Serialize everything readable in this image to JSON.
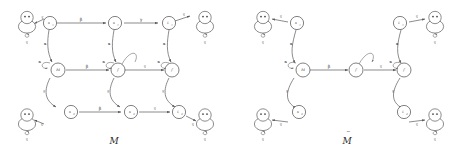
{
  "figure": {
    "panels": [
      {
        "id": "left",
        "caption": "M",
        "caption_accent": "",
        "nodes": [
          {
            "id": "s1",
            "label": "s",
            "sub": "1",
            "kind": "state"
          },
          {
            "id": "s2",
            "label": "s",
            "sub": "1",
            "kind": "state"
          },
          {
            "id": "t1",
            "label": "t",
            "sub": "1",
            "kind": "state"
          },
          {
            "id": "M",
            "label": "M",
            "sub": "",
            "kind": "state"
          },
          {
            "id": "f1",
            "label": "f",
            "sub": "",
            "kind": "state"
          },
          {
            "id": "f2",
            "label": "f",
            "sub": "",
            "kind": "state"
          },
          {
            "id": "s3",
            "label": "s",
            "sub": "2",
            "kind": "state"
          },
          {
            "id": "s4",
            "label": "s",
            "sub": "2",
            "kind": "state"
          },
          {
            "id": "t2",
            "label": "t",
            "sub": "2",
            "kind": "state"
          },
          {
            "id": "tl",
            "label": "",
            "sub": "",
            "kind": "terminal"
          },
          {
            "id": "tr",
            "label": "",
            "sub": "",
            "kind": "terminal"
          },
          {
            "id": "bl",
            "label": "",
            "sub": "",
            "kind": "terminal"
          },
          {
            "id": "br",
            "label": "",
            "sub": "",
            "kind": "terminal"
          }
        ],
        "edges": [
          {
            "from": "s1",
            "to": "tl",
            "label": "τ"
          },
          {
            "from": "s1",
            "to": "s2",
            "label": "β"
          },
          {
            "from": "s2",
            "to": "t1",
            "label": "γ"
          },
          {
            "from": "t1",
            "to": "tr",
            "label": "τ"
          },
          {
            "from": "s1",
            "to": "M",
            "label": "α"
          },
          {
            "from": "s2",
            "to": "f1",
            "label": "α"
          },
          {
            "from": "t1",
            "to": "f2",
            "label": "α"
          },
          {
            "from": "M",
            "to": "f1",
            "label": "β"
          },
          {
            "from": "f1",
            "to": "f2",
            "label": "τ"
          },
          {
            "from": "M",
            "to": "s3",
            "label": "γ"
          },
          {
            "from": "f1",
            "to": "s4",
            "label": "γ"
          },
          {
            "from": "f2",
            "to": "t2",
            "label": "γ"
          },
          {
            "from": "s3",
            "to": "s4",
            "label": "β"
          },
          {
            "from": "s4",
            "to": "t2",
            "label": "τ"
          },
          {
            "from": "s3",
            "to": "bl",
            "label": "τ"
          },
          {
            "from": "t2",
            "to": "br",
            "label": "τ"
          }
        ],
        "self_loops": [
          {
            "at": "tl",
            "label": "τ"
          },
          {
            "at": "tr",
            "label": "τ"
          },
          {
            "at": "bl",
            "label": "τ"
          },
          {
            "at": "br",
            "label": "τ"
          },
          {
            "at": "f1",
            "label": "α"
          },
          {
            "at": "f2",
            "label": "α"
          }
        ]
      },
      {
        "id": "right",
        "caption": "M",
        "caption_accent": "~",
        "nodes": [
          {
            "id": "rs1",
            "label": "s",
            "sub": "1",
            "kind": "state"
          },
          {
            "id": "rM",
            "label": "M",
            "sub": "",
            "kind": "state"
          },
          {
            "id": "rf0",
            "label": "f",
            "sub": "",
            "kind": "state"
          },
          {
            "id": "rf1",
            "label": "f",
            "sub": "",
            "kind": "state"
          },
          {
            "id": "rt1",
            "label": "t",
            "sub": "1",
            "kind": "state"
          },
          {
            "id": "rs2",
            "label": "s",
            "sub": "2",
            "kind": "state"
          },
          {
            "id": "rt2",
            "label": "t",
            "sub": "2",
            "kind": "state"
          },
          {
            "id": "rtl",
            "label": "",
            "sub": "",
            "kind": "terminal"
          },
          {
            "id": "rtr",
            "label": "",
            "sub": "",
            "kind": "terminal"
          },
          {
            "id": "rbl",
            "label": "",
            "sub": "",
            "kind": "terminal"
          },
          {
            "id": "rbr",
            "label": "",
            "sub": "",
            "kind": "terminal"
          }
        ],
        "edges": [
          {
            "from": "rs1",
            "to": "rtl",
            "label": "τ"
          },
          {
            "from": "rs1",
            "to": "rM",
            "label": "α"
          },
          {
            "from": "rM",
            "to": "rf0",
            "label": "β"
          },
          {
            "from": "rf0",
            "to": "rf1",
            "label": "τ"
          },
          {
            "from": "rt1",
            "to": "rtr",
            "label": "τ"
          },
          {
            "from": "rt1",
            "to": "rf1",
            "label": "α"
          },
          {
            "from": "rM",
            "to": "rs2",
            "label": "γ"
          },
          {
            "from": "rf1",
            "to": "rt2",
            "label": "γ"
          },
          {
            "from": "rs2",
            "to": "rbl",
            "label": "τ"
          },
          {
            "from": "rt2",
            "to": "rbr",
            "label": "τ"
          }
        ],
        "self_loops": [
          {
            "at": "rtl",
            "label": "τ"
          },
          {
            "at": "rtr",
            "label": "τ"
          },
          {
            "at": "rbl",
            "label": "τ"
          },
          {
            "at": "rbr",
            "label": "τ"
          },
          {
            "at": "rM",
            "label": "α"
          },
          {
            "at": "rf1",
            "label": "α"
          }
        ],
        "initial_marker": {
          "at": "rf0"
        }
      }
    ],
    "alphabet": [
      "α",
      "β",
      "γ",
      "τ"
    ],
    "colors": {
      "stroke": "#4a4a4a",
      "text": "#2e2e2e",
      "background": "#ffffff"
    }
  }
}
